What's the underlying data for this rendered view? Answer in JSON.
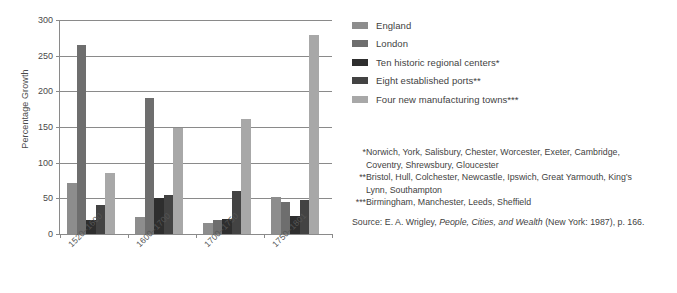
{
  "chart_data": {
    "type": "bar",
    "title": "",
    "xlabel": "",
    "ylabel": "Percentage Growth",
    "ylim": [
      0,
      300
    ],
    "yticks": [
      0,
      50,
      100,
      150,
      200,
      250,
      300
    ],
    "grid": true,
    "legend_position": "right",
    "categories": [
      "1520–1600",
      "1600–1700",
      "1700–1750",
      "1750–1801"
    ],
    "series": [
      {
        "name": "England",
        "color": "#8d8d8d",
        "values": [
          71,
          24,
          16,
          52
        ]
      },
      {
        "name": "London",
        "color": "#6e6e6e",
        "values": [
          265,
          190,
          19,
          45
        ]
      },
      {
        "name": "Ten historic regional centers*",
        "color": "#2e2e2e",
        "values": [
          19,
          50,
          21,
          25
        ]
      },
      {
        "name": "Eight established ports**",
        "color": "#434343",
        "values": [
          40,
          54,
          60,
          48
        ]
      },
      {
        "name": "Four new manufacturing towns***",
        "color": "#a8a8a8",
        "values": [
          85,
          148,
          161,
          279
        ]
      }
    ]
  },
  "legend": {
    "items": [
      {
        "label": "England",
        "color": "#8d8d8d"
      },
      {
        "label": "London",
        "color": "#6e6e6e"
      },
      {
        "label": "Ten historic regional centers*",
        "color": "#2e2e2e"
      },
      {
        "label": "Eight established ports**",
        "color": "#434343"
      },
      {
        "label": "Four new manufacturing towns***",
        "color": "#a8a8a8"
      }
    ]
  },
  "notes": {
    "note1_marker": "*",
    "note1_text": "Norwich, York, Salisbury, Chester, Worcester, Exeter, Cambridge,",
    "note1_cont": "Coventry, Shrewsbury, Gloucester",
    "note2_marker": "**",
    "note2_text": "Bristol, Hull, Colchester, Newcastle, Ipswich, Great Yarmouth, King’s",
    "note2_cont": "Lynn, Southampton",
    "note3_marker": "***",
    "note3_text": "Birmingham, Manchester, Leeds, Sheffield",
    "source_prefix": "Source: E. A. Wrigley, ",
    "source_title": "People, Cities, and Wealth",
    "source_suffix": " (New York: 1987), p. 166."
  }
}
